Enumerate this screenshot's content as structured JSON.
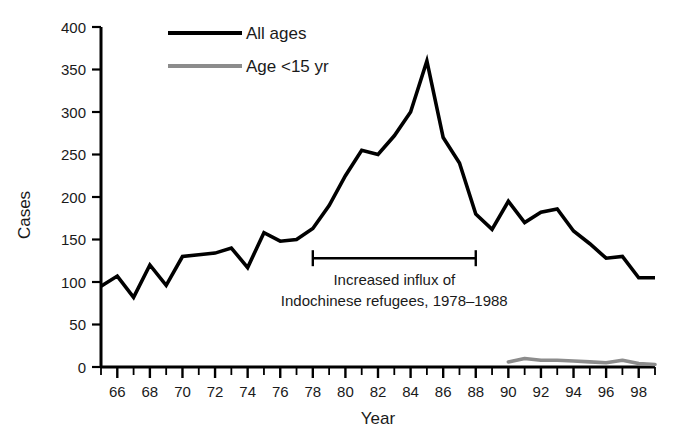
{
  "chart_data": {
    "type": "line",
    "title": "",
    "xlabel": "Year",
    "ylabel": "Cases",
    "xlim": [
      65,
      99
    ],
    "ylim": [
      0,
      400
    ],
    "yticks": [
      0,
      50,
      100,
      150,
      200,
      250,
      300,
      350,
      400
    ],
    "ytick_labels": [
      "0",
      "50",
      "100",
      "150",
      "200",
      "250",
      "300",
      "350",
      "400"
    ],
    "xticks": [
      66,
      68,
      70,
      72,
      74,
      76,
      78,
      80,
      82,
      84,
      86,
      88,
      90,
      92,
      94,
      96,
      98
    ],
    "xtick_labels": [
      "66",
      "68",
      "70",
      "72",
      "74",
      "76",
      "78",
      "80",
      "82",
      "84",
      "86",
      "88",
      "90",
      "92",
      "94",
      "96",
      "98"
    ],
    "xtick_minor_step": 1,
    "grid": false,
    "legend_position": "top-center",
    "series": [
      {
        "name": "All ages",
        "color": "#000000",
        "linewidth": 3.6,
        "x": [
          65,
          66,
          67,
          68,
          69,
          70,
          71,
          72,
          73,
          74,
          75,
          76,
          77,
          78,
          79,
          80,
          81,
          82,
          83,
          84,
          85,
          86,
          87,
          88,
          89,
          90,
          91,
          92,
          93,
          94,
          95,
          96,
          97,
          98,
          99
        ],
        "values": [
          95,
          107,
          82,
          120,
          96,
          130,
          132,
          134,
          140,
          117,
          158,
          148,
          150,
          163,
          190,
          225,
          255,
          250,
          272,
          300,
          360,
          270,
          240,
          180,
          162,
          195,
          170,
          182,
          186,
          160,
          145,
          128,
          130,
          105,
          105
        ]
      },
      {
        "name": "Age <15 yr",
        "color": "#8c8c8c",
        "linewidth": 3.6,
        "x": [
          90,
          91,
          92,
          93,
          94,
          95,
          96,
          97,
          98,
          99
        ],
        "values": [
          6,
          10,
          8,
          8,
          7,
          6,
          5,
          8,
          4,
          3
        ]
      }
    ],
    "legend": [
      {
        "label": "All ages",
        "color": "#000000"
      },
      {
        "label": "Age <15 yr",
        "color": "#8c8c8c"
      }
    ],
    "annotations": [
      {
        "name": "refugee-influx-bracket",
        "line1": "Increased influx of",
        "line2": "Indochinese refugees, 1978–1988",
        "x_start": 78,
        "x_end": 88,
        "y": 128
      }
    ]
  }
}
